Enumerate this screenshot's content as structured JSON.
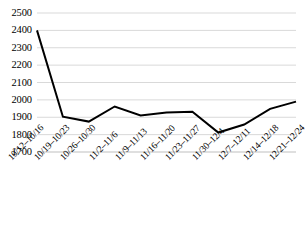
{
  "chart_data": {
    "type": "line",
    "title": "",
    "subtitle": "",
    "xlabel": "",
    "ylabel": "",
    "categories": [
      "10/12–10/16",
      "10/19–10/23",
      "10/26–10/30",
      "11/2–11/6",
      "11/9–11/13",
      "11/16–11/20",
      "11/23–11/27",
      "11/30–12/4",
      "12/7–12/11",
      "12/14–12/18",
      "12/21–12/24"
    ],
    "values": [
      2400,
      1903,
      1875,
      1962,
      1910,
      1928,
      1932,
      1812,
      1858,
      1948,
      1990
    ],
    "series": [
      {
        "name": "series-1",
        "values": [
          2400,
          1903,
          1875,
          1962,
          1910,
          1928,
          1932,
          1812,
          1858,
          1948,
          1990
        ],
        "color": "#000000"
      }
    ],
    "ylim": [
      1700,
      2500
    ],
    "ytick_values": [
      2500,
      2400,
      2300,
      2200,
      2100,
      2000,
      1900,
      1800,
      1700
    ],
    "ytick_labels": [
      "2500",
      "2400",
      "2300",
      "2200",
      "2100",
      "2000",
      "1900",
      "1800",
      "1700"
    ],
    "ytick_step": 100,
    "grid": {
      "horizontal": true,
      "vertical": false,
      "color": "#d9d9d9"
    },
    "legend": {
      "visible": false,
      "position": "none",
      "entries": []
    },
    "annotations": [],
    "line_style": {
      "color": "#000000",
      "width": 2,
      "markers": false
    },
    "axis": {
      "bottom_line_color": "#bfbfbf",
      "x_tick_label_rotation": -45
    },
    "background_color": "#ffffff"
  }
}
